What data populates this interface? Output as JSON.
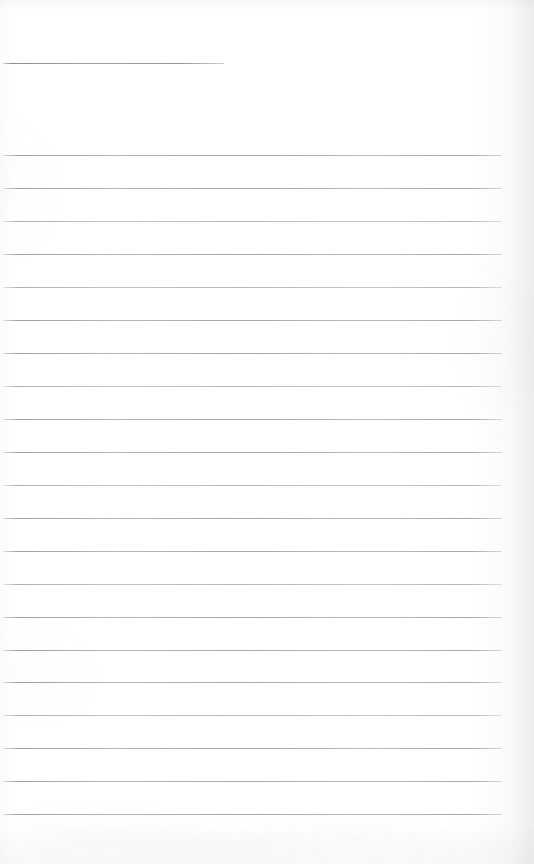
{
  "document": {
    "kind": "scanned-ruled-notebook-page",
    "title": "Blank ruled notebook page",
    "page_width": 534,
    "page_height": 864,
    "paper_color": "#fefefe",
    "rule_color": "#9aa0aa",
    "text_content": "",
    "has_handwriting": false,
    "has_printed_text": false
  },
  "ruling": {
    "line_thickness_px": 1,
    "line_spacing_px": 33,
    "left_margin_px": 3,
    "right_edge_px": 502,
    "total_lines": 22,
    "header_rule": {
      "label": "header-rule",
      "y": 63,
      "x_start": 3,
      "x_end": 224,
      "length_px": 221,
      "is_short": true
    },
    "body_rules": [
      {
        "y": 155,
        "x_start": 3,
        "x_end": 502,
        "weight": "strong"
      },
      {
        "y": 188,
        "x_start": 3,
        "x_end": 502,
        "weight": "strong"
      },
      {
        "y": 221,
        "x_start": 3,
        "x_end": 502,
        "weight": "faint"
      },
      {
        "y": 254,
        "x_start": 3,
        "x_end": 502,
        "weight": "strong"
      },
      {
        "y": 287,
        "x_start": 3,
        "x_end": 502,
        "weight": "faint"
      },
      {
        "y": 320,
        "x_start": 3,
        "x_end": 502,
        "weight": "strong"
      },
      {
        "y": 353,
        "x_start": 3,
        "x_end": 502,
        "weight": "strong"
      },
      {
        "y": 386,
        "x_start": 3,
        "x_end": 502,
        "weight": "faint"
      },
      {
        "y": 419,
        "x_start": 3,
        "x_end": 502,
        "weight": "strong"
      },
      {
        "y": 452,
        "x_start": 3,
        "x_end": 502,
        "weight": "strong"
      },
      {
        "y": 485,
        "x_start": 3,
        "x_end": 502,
        "weight": "faint"
      },
      {
        "y": 518,
        "x_start": 3,
        "x_end": 502,
        "weight": "strong"
      },
      {
        "y": 551,
        "x_start": 3,
        "x_end": 502,
        "weight": "strong"
      },
      {
        "y": 584,
        "x_start": 3,
        "x_end": 502,
        "weight": "faint"
      },
      {
        "y": 617,
        "x_start": 3,
        "x_end": 502,
        "weight": "strong"
      },
      {
        "y": 650,
        "x_start": 3,
        "x_end": 502,
        "weight": "strong"
      },
      {
        "y": 682,
        "x_start": 3,
        "x_end": 502,
        "weight": "strong"
      },
      {
        "y": 715,
        "x_start": 3,
        "x_end": 502,
        "weight": "faint"
      },
      {
        "y": 748,
        "x_start": 3,
        "x_end": 502,
        "weight": "strong"
      },
      {
        "y": 781,
        "x_start": 3,
        "x_end": 502,
        "weight": "strong"
      },
      {
        "y": 814,
        "x_start": 3,
        "x_end": 502,
        "weight": "strong"
      }
    ]
  },
  "regions": {
    "top_blank_band": {
      "label": "top-blank-band",
      "y_start": 0,
      "y_end": 62
    },
    "header_gap": {
      "label": "header-gap",
      "y_start": 64,
      "y_end": 154
    },
    "bottom_blank_band": {
      "label": "bottom-blank-band",
      "y_start": 815,
      "y_end": 864
    }
  }
}
